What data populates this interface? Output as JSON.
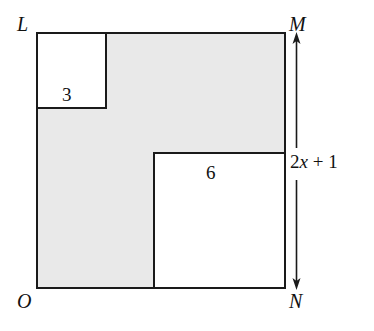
{
  "figure": {
    "background_color": "#ffffff",
    "shaded_color": "#e9e9e9",
    "line_color": "#1a1a1a"
  },
  "vertices": {
    "top_left": "L",
    "top_right": "M",
    "bottom_left": "O",
    "bottom_right": "N"
  },
  "regions": [
    {
      "label": "3",
      "name": "small-cutout-square",
      "fill": "#ffffff"
    },
    {
      "label": "6",
      "name": "large-cutout-square",
      "fill": "#ffffff"
    }
  ],
  "dimension": {
    "coefficient": "2",
    "variable": "x",
    "operator": "+",
    "constant": "1",
    "full_label": "2x + 1",
    "icon_up": "arrow-up",
    "icon_down": "arrow-down"
  }
}
